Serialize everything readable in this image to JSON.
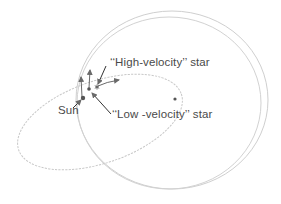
{
  "diagram": {
    "title": "",
    "labels": {
      "sun": "Sun",
      "high_velocity_star": "‘‘High-velocity’’ star",
      "low_velocity_star": "‘‘Low -velocity’’ star"
    },
    "elements": {
      "galactic_center": {
        "x": 175,
        "y": 99
      },
      "sun": {
        "x": 83,
        "y": 98
      },
      "low_velocity_star": {
        "x": 89,
        "y": 89
      },
      "high_velocity_star": {
        "x": 97,
        "y": 87
      }
    },
    "orbits": [
      {
        "name": "circular-orbit-outer",
        "cx": 172,
        "cy": 100,
        "rx": 96,
        "ry": 89
      },
      {
        "name": "circular-orbit-inner",
        "cx": 169,
        "cy": 103,
        "rx": 92,
        "ry": 86
      },
      {
        "name": "eccentric-orbit",
        "cx": 100,
        "cy": 122,
        "rx": 86,
        "ry": 41,
        "rotate": -19
      }
    ],
    "colors": {
      "orbit": "#c8c8c8",
      "arrow": "#6a6a6a",
      "dot": "#555555",
      "text": "#4a4a4a"
    }
  }
}
